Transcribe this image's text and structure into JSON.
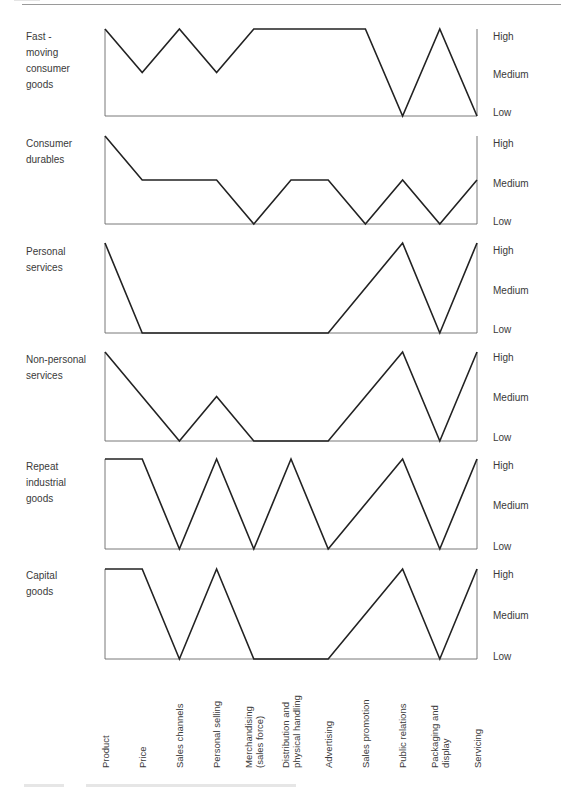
{
  "levels": {
    "high": "High",
    "medium": "Medium",
    "low": "Low"
  },
  "chart_data": {
    "type": "line",
    "title": "",
    "xlabel": "",
    "ylabel": "",
    "y_levels": [
      "Low",
      "Medium",
      "High"
    ],
    "ylim": [
      0,
      2
    ],
    "grid": false,
    "legend": "none (row labels on left, level labels on right)",
    "categories": [
      "Product",
      "Price",
      "Sales channels",
      "Personal selling",
      "Merchandising (sales force)",
      "Distribution and physical handling",
      "Advertising",
      "Sales promotion",
      "Public relations",
      "Packaging and display",
      "Servicing"
    ],
    "series": [
      {
        "name": "Fast-moving consumer goods",
        "values": [
          "High",
          "Medium",
          "High",
          "Medium",
          "High",
          "High",
          "High",
          "High",
          "Low",
          "High",
          "Low"
        ]
      },
      {
        "name": "Consumer durables",
        "values": [
          "High",
          "Medium",
          "Medium",
          "Medium",
          "Low",
          "Medium",
          "Medium",
          "Low",
          "Medium",
          "Low",
          "Medium"
        ]
      },
      {
        "name": "Personal services",
        "values": [
          "High",
          "Low",
          "Low",
          "Low",
          "Low",
          "Low",
          "Low",
          "Medium",
          "High",
          "Low",
          "High"
        ]
      },
      {
        "name": "Non-personal services",
        "values": [
          "High",
          "Medium",
          "Low",
          "Medium",
          "Low",
          "Low",
          "Low",
          "Medium",
          "High",
          "Low",
          "High"
        ]
      },
      {
        "name": "Repeat industrial goods",
        "values": [
          "High",
          "High",
          "Low",
          "High",
          "Low",
          "High",
          "Low",
          "Medium",
          "High",
          "Low",
          "High"
        ]
      },
      {
        "name": "Capital goods",
        "values": [
          "High",
          "High",
          "Low",
          "High",
          "Low",
          "Low",
          "Low",
          "Medium",
          "High",
          "Low",
          "High"
        ]
      }
    ]
  },
  "rows": [
    {
      "label": "Fast -\nmoving\nconsumer\ngoods"
    },
    {
      "label": "Consumer\ndurables"
    },
    {
      "label": "Personal\nservices"
    },
    {
      "label": "Non-personal\nservices"
    },
    {
      "label": "Repeat\nindustrial\ngoods"
    },
    {
      "label": "Capital\ngoods"
    }
  ],
  "category_labels": [
    "Product",
    "Price",
    "Sales channels",
    "Personal selling",
    "Merchandising\n(sales force)",
    "Distribution and\nphysical handling",
    "Advertising",
    "Sales promotion",
    "Public relations",
    "Packaging and\ndisplay",
    "Servicing"
  ]
}
